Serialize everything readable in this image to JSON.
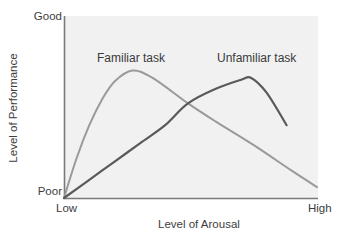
{
  "chart_data": {
    "type": "line",
    "title": "",
    "xlabel": "Level of Arousal",
    "ylabel": "Level of Performance",
    "x_tick_labels": [
      "Low",
      "High"
    ],
    "y_tick_labels": [
      "Poor",
      "Good"
    ],
    "xlim": [
      0,
      100
    ],
    "ylim": [
      0,
      100
    ],
    "grid": false,
    "legend": "inline labels above curves",
    "annotations": [
      "Familiar task",
      "Unfamiliar task"
    ],
    "series": [
      {
        "name": "Familiar task",
        "color": "#9a9a9a",
        "x": [
          0,
          5,
          10,
          15,
          20,
          27,
          35,
          49,
          60,
          75,
          90,
          100
        ],
        "y": [
          0,
          22,
          40,
          54,
          64,
          70,
          66,
          52,
          42,
          29,
          15,
          6
        ]
      },
      {
        "name": "Unfamiliar task",
        "color": "#5a5a5a",
        "x": [
          0,
          10,
          20,
          30,
          40,
          49,
          60,
          70,
          74,
          80,
          88
        ],
        "y": [
          0,
          10,
          20,
          30,
          40,
          52,
          60,
          65,
          66,
          58,
          40
        ]
      }
    ]
  },
  "labels": {
    "y_top": "Good",
    "y_bottom": "Poor",
    "x_left": "Low",
    "x_right": "High",
    "x_title": "Level of Arousal",
    "y_title": "Level of Performance",
    "series_familiar": "Familiar task",
    "series_unfamiliar": "Unfamiliar task"
  },
  "colors": {
    "plot_background": "#f1f1f1",
    "axis": "#7a7a7a",
    "familiar_line": "#9a9a9a",
    "unfamiliar_line": "#5a5a5a",
    "text": "#3d3d3d"
  }
}
